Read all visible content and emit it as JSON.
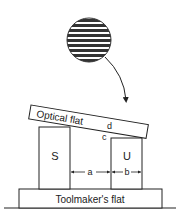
{
  "diagram": {
    "fringe_pattern": {
      "stripes": 8
    },
    "labels": {
      "optical_flat": "Optical flat",
      "toolmakers_flat": "Toolmaker's flat",
      "standard": "S",
      "unknown": "U",
      "point_c": "c",
      "point_d": "d",
      "gap_a": "a",
      "gap_b": "b"
    },
    "colors": {
      "stroke": "#222222",
      "background": "#ffffff"
    }
  }
}
